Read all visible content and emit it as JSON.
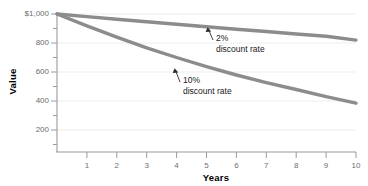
{
  "chart_data": {
    "type": "line",
    "title": "",
    "subtitle": "",
    "xlabel": "Years",
    "ylabel": "Value",
    "x": [
      0,
      1,
      2,
      3,
      4,
      5,
      6,
      7,
      8,
      9,
      10
    ],
    "xlim": [
      0,
      10
    ],
    "ylim": [
      0,
      1000
    ],
    "xticks": [
      "1",
      "2",
      "3",
      "4",
      "5",
      "6",
      "7",
      "8",
      "9",
      "10"
    ],
    "xtick_values": [
      1,
      2,
      3,
      4,
      5,
      6,
      7,
      8,
      9,
      10
    ],
    "yticks": [
      "200",
      "400",
      "600",
      "800",
      "$1,000"
    ],
    "ytick_values": [
      200,
      400,
      600,
      800,
      1000
    ],
    "grid": "horizontal-major-light",
    "legend": "none-inline-annotations",
    "minor_ticks": true,
    "series": [
      {
        "name": "2% discount rate",
        "color": "#8c8c8c",
        "values": [
          1000,
          982,
          964,
          946,
          929,
          912,
          895,
          879,
          862,
          846,
          820
        ]
      },
      {
        "name": "10% discount rate",
        "color": "#8c8c8c",
        "values": [
          1000,
          918,
          840,
          767,
          700,
          637,
          579,
          527,
          479,
          430,
          385
        ]
      }
    ],
    "annotations": [
      {
        "id": "annotation-2-percent",
        "line1": "2%",
        "line2": "discount rate",
        "points_to_x": 5.6,
        "points_to_y": 901
      },
      {
        "id": "annotation-10-percent",
        "line1": "10%",
        "line2": "discount rate",
        "points_to_x": 4.5,
        "points_to_y": 668
      }
    ]
  },
  "colors": {
    "line": "#8c8c8c",
    "axis": "#9a9a9a",
    "grid": "#ededed",
    "tick_label": "#6e6e6e",
    "axis_title": "#000000",
    "annotation": "#1a1a1a",
    "background": "#ffffff"
  }
}
